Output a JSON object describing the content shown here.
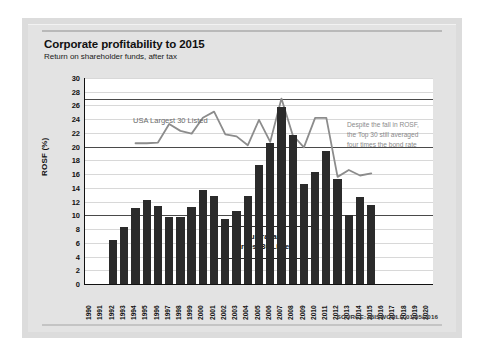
{
  "card": {
    "title": "Corporate profitability to 2015",
    "subtitle": "Return on shareholder funds, after tax",
    "source": "SOURCE: IBISWORLD 01/05/2016"
  },
  "annotations": {
    "usa_series_label": "USA Largest 30 Listed",
    "aus_series_label_line1": "Australian",
    "aus_series_label_line2": "Largest 30 Listed",
    "callout_line1": "Despite the fall in ROSF,",
    "callout_line2": "the Top 30 still averaged",
    "callout_line3": "four times the bond rate"
  },
  "colors": {
    "bar": "#2b2b2b",
    "line": "#8c8c8c",
    "plot_background": "#ffffff",
    "card_background": "#e3e3e3",
    "gridline": "#d8d8d8",
    "gridline_major": "#4a4a4a"
  },
  "chart_data": {
    "type": "bar",
    "title": "Corporate profitability to 2015",
    "subtitle": "Return on shareholder funds, after tax",
    "xlabel": "Year to June",
    "ylabel": "ROSF (%)",
    "ylim": [
      0,
      30
    ],
    "ytick_step": 2,
    "yticks": [
      0,
      2,
      4,
      6,
      8,
      10,
      12,
      14,
      16,
      18,
      20,
      22,
      24,
      26,
      28,
      30
    ],
    "grid": true,
    "major_gridlines": [
      10,
      20,
      27
    ],
    "legend": "inline-labels",
    "categories": [
      "1990",
      "1991",
      "1992",
      "1993",
      "1994",
      "1995",
      "1996",
      "1997",
      "1998",
      "1999",
      "2000",
      "2001",
      "2002",
      "2003",
      "2004",
      "2005",
      "2006",
      "2007",
      "2008",
      "2009",
      "2010",
      "2011",
      "2012",
      "2013",
      "2014",
      "2015",
      "2016",
      "2017",
      "2018",
      "2019",
      "2020"
    ],
    "series": [
      {
        "name": "Australian Largest 30 Listed",
        "type": "bar",
        "color": "#2b2b2b",
        "values": [
          null,
          null,
          6.4,
          8.3,
          11.0,
          12.3,
          11.3,
          9.7,
          9.8,
          11.2,
          13.7,
          12.8,
          9.5,
          10.7,
          12.8,
          17.4,
          20.6,
          25.8,
          21.7,
          14.5,
          16.3,
          19.4,
          15.3,
          10.1,
          12.7,
          11.5,
          null,
          null,
          null,
          null,
          null
        ]
      },
      {
        "name": "USA Largest 30 Listed",
        "type": "line",
        "color": "#8c8c8c",
        "values": [
          null,
          null,
          null,
          null,
          20.5,
          20.5,
          20.6,
          23.3,
          22.3,
          21.9,
          24.2,
          25.1,
          21.8,
          21.5,
          20.2,
          23.9,
          20.7,
          27.0,
          21.7,
          19.9,
          24.2,
          24.2,
          15.6,
          16.6,
          15.8,
          16.1,
          null,
          null,
          null,
          null,
          null
        ]
      }
    ]
  }
}
